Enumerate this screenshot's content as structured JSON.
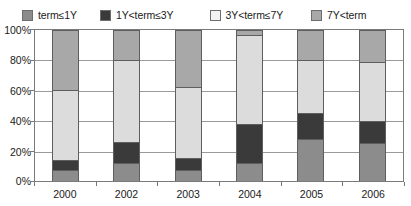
{
  "chart_data": {
    "type": "bar",
    "stacked": true,
    "stack_mode": "percent",
    "title": "",
    "xlabel": "",
    "ylabel": "",
    "ylim": [
      0,
      100
    ],
    "ytick_labels": [
      "0%",
      "20%",
      "40%",
      "60%",
      "80%",
      "100%"
    ],
    "ytick_values": [
      0,
      20,
      40,
      60,
      80,
      100
    ],
    "grid": true,
    "legend_position": "top",
    "categories": [
      "2000",
      "2002",
      "2003",
      "2004",
      "2005",
      "2006"
    ],
    "series": [
      {
        "name": "term≤1Y",
        "color": "#8c8c8c",
        "values": [
          7,
          12,
          7,
          12,
          28,
          25
        ]
      },
      {
        "name": "1Y<term≤3Y",
        "color": "#3a3a3a",
        "values": [
          7,
          14,
          8,
          26,
          17,
          15
        ]
      },
      {
        "name": "3Y<term≤7Y",
        "color": "#dcdcdc",
        "values": [
          46,
          54,
          47,
          59,
          35,
          39
        ]
      },
      {
        "name": "7Y<term",
        "color": "#a8a8a8",
        "values": [
          40,
          20,
          38,
          3,
          20,
          21
        ]
      }
    ]
  },
  "legend": {
    "items": [
      {
        "label": "term≤1Y",
        "swatch": "#8c8c8c",
        "icon": "legend-swatch-icon"
      },
      {
        "label": "1Y<term≤3Y",
        "swatch": "#3a3a3a",
        "icon": "legend-swatch-icon"
      },
      {
        "label": "3Y<term≤7Y",
        "swatch": "#f2f2f2",
        "icon": "legend-swatch-icon"
      },
      {
        "label": "7Y<term",
        "swatch": "#a8a8a8",
        "icon": "legend-swatch-icon"
      }
    ]
  },
  "axes": {
    "y_labels": [
      "100%",
      "80%",
      "60%",
      "40%",
      "20%",
      "0%"
    ],
    "x_labels": [
      "2000",
      "2002",
      "2003",
      "2004",
      "2005",
      "2006"
    ]
  }
}
